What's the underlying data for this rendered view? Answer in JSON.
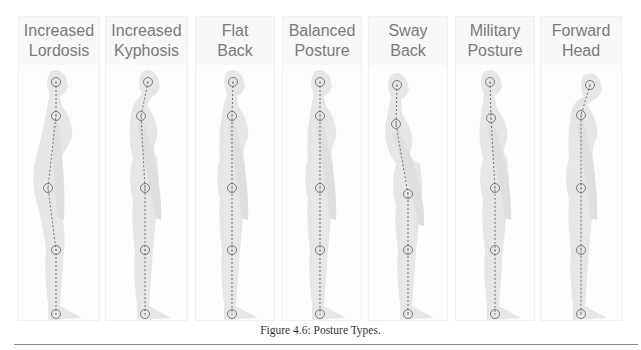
{
  "figure": {
    "caption": "Figure 4.6: Posture Types.",
    "colors": {
      "silhouette": "#e6e6e6",
      "plumb_line": "#6f6f6f",
      "label_text": "#7a7a7a",
      "caption_text": "#333333",
      "rule": "#8a8a8a"
    },
    "panels": [
      {
        "label": "Increased\nLordosis",
        "x": 18,
        "w": 82,
        "points": [
          [
            56,
            82
          ],
          [
            56,
            116
          ],
          [
            48,
            188
          ],
          [
            56,
            250
          ],
          [
            56,
            314
          ]
        ]
      },
      {
        "label": "Increased\nKyphosis",
        "x": 105,
        "w": 83,
        "points": [
          [
            148,
            82
          ],
          [
            141,
            116
          ],
          [
            145,
            188
          ],
          [
            145,
            250
          ],
          [
            145,
            314
          ]
        ]
      },
      {
        "label": "Flat\nBack",
        "x": 195,
        "w": 80,
        "points": [
          [
            233,
            82
          ],
          [
            232,
            116
          ],
          [
            232,
            188
          ],
          [
            232,
            250
          ],
          [
            232,
            314
          ]
        ]
      },
      {
        "label": "Balanced\nPosture",
        "x": 282,
        "w": 80,
        "points": [
          [
            320,
            82
          ],
          [
            320,
            116
          ],
          [
            320,
            188
          ],
          [
            320,
            250
          ],
          [
            320,
            314
          ]
        ]
      },
      {
        "label": "Sway\nBack",
        "x": 368,
        "w": 80,
        "points": [
          [
            397,
            85
          ],
          [
            396,
            124
          ],
          [
            408,
            194
          ],
          [
            408,
            250
          ],
          [
            408,
            314
          ]
        ]
      },
      {
        "label": "Military\nPosture",
        "x": 455,
        "w": 80,
        "points": [
          [
            490,
            82
          ],
          [
            491,
            118
          ],
          [
            495,
            188
          ],
          [
            495,
            250
          ],
          [
            495,
            314
          ]
        ]
      },
      {
        "label": "Forward\nHead",
        "x": 540,
        "w": 82,
        "points": [
          [
            590,
            85
          ],
          [
            581,
            115
          ],
          [
            581,
            188
          ],
          [
            581,
            250
          ],
          [
            581,
            314
          ]
        ]
      }
    ]
  }
}
